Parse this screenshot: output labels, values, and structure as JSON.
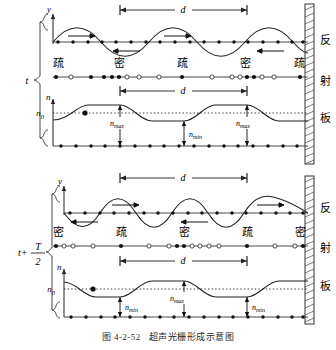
{
  "figure": {
    "caption_number": "图 4-2-52",
    "caption_title": "超声光栅形成示意图",
    "plate_label_chars": [
      "反",
      "射",
      "板"
    ],
    "plate_label": "反射板"
  },
  "panels": [
    {
      "id": "time-t",
      "time_label": "t",
      "time_label_type": "plain",
      "wave": {
        "axis_label": "y",
        "span_label": "d",
        "phase": "sin",
        "arrows": [
          {
            "dir": "right",
            "x_frac": 0.13
          },
          {
            "dir": "left",
            "x_frac": 0.38
          },
          {
            "dir": "right",
            "x_frac": 0.63
          },
          {
            "dir": "left",
            "x_frac": 0.88
          }
        ]
      },
      "density": {
        "labels": [
          "疏",
          "密",
          "疏",
          "密",
          "疏"
        ]
      },
      "index": {
        "axis_label": "n",
        "baseline_label": "n0",
        "baseline_label_text": "n",
        "baseline_sub": "0",
        "span_label": "d",
        "phase": "cos",
        "annotations": [
          {
            "text": "n",
            "sub": "max",
            "kind": "max"
          },
          {
            "text": "n",
            "sub": "min",
            "kind": "min"
          },
          {
            "text": "n",
            "sub": "max",
            "kind": "max"
          }
        ]
      }
    },
    {
      "id": "time-t-plus-half-T",
      "time_label": "t + T/2",
      "time_label_type": "fraction",
      "time_label_lead": "t+",
      "time_label_num": "T",
      "time_label_den": "2",
      "wave": {
        "axis_label": "y",
        "span_label": "d",
        "phase": "-sin",
        "arrows": [
          {
            "dir": "left",
            "x_frac": 0.13
          },
          {
            "dir": "right",
            "x_frac": 0.38
          },
          {
            "dir": "left",
            "x_frac": 0.63
          },
          {
            "dir": "right",
            "x_frac": 0.88
          }
        ]
      },
      "density": {
        "labels": [
          "密",
          "疏",
          "密",
          "疏",
          "密"
        ]
      },
      "index": {
        "axis_label": "n",
        "baseline_label": "n0",
        "baseline_label_text": "n",
        "baseline_sub": "0",
        "span_label": "d",
        "phase": "-cos",
        "annotations": [
          {
            "text": "n",
            "sub": "min",
            "kind": "min"
          },
          {
            "text": "n",
            "sub": "max",
            "kind": "max"
          },
          {
            "text": "n",
            "sub": "min",
            "kind": "min"
          }
        ]
      }
    }
  ],
  "style": {
    "ink": "#1a1a1a",
    "line": "#333333",
    "dot_fill": "#111111",
    "dot_hollow": "#ffffff",
    "plate_hatch": "#444444"
  }
}
